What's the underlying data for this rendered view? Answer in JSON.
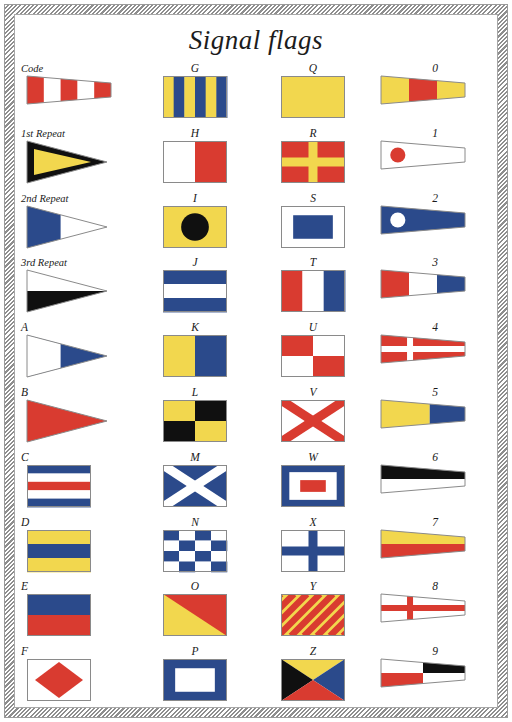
{
  "page": {
    "title": "Signal flags",
    "background": "#ffffff",
    "frame_style": "diagonal-hatch-border"
  },
  "palette": {
    "red": "#d93b30",
    "blue": "#2b4a8b",
    "yellow": "#f2d74e",
    "white": "#ffffff",
    "black": "#101010",
    "outline": "#8a8a8a"
  },
  "columns": [
    {
      "name": "column-repeaters-and-a-f",
      "cells": [
        {
          "label": "Code",
          "shape": "pennant",
          "pattern": "stripes-v",
          "colors": [
            "red",
            "white",
            "red",
            "white",
            "red"
          ]
        },
        {
          "label": "1st Repeat",
          "shape": "triangle-pennant",
          "pattern": "border-triangle",
          "colors": [
            "yellow",
            "black"
          ]
        },
        {
          "label": "2nd Repeat",
          "shape": "triangle-pennant",
          "pattern": "half-v",
          "colors": [
            "blue",
            "white"
          ]
        },
        {
          "label": "3rd Repeat",
          "shape": "triangle-pennant",
          "pattern": "half-h",
          "colors": [
            "white",
            "black"
          ]
        },
        {
          "label": "A",
          "shape": "swallowtail",
          "pattern": "half-v",
          "colors": [
            "white",
            "blue"
          ]
        },
        {
          "label": "B",
          "shape": "swallowtail",
          "pattern": "solid",
          "colors": [
            "red"
          ]
        },
        {
          "label": "C",
          "shape": "rect",
          "pattern": "stripes-h5",
          "colors": [
            "blue",
            "white",
            "red",
            "white",
            "blue"
          ]
        },
        {
          "label": "D",
          "shape": "rect",
          "pattern": "stripes-h3",
          "colors": [
            "yellow",
            "blue",
            "yellow"
          ]
        },
        {
          "label": "E",
          "shape": "rect",
          "pattern": "stripes-h2",
          "colors": [
            "blue",
            "red"
          ]
        },
        {
          "label": "F",
          "shape": "rect",
          "pattern": "diamond",
          "colors": [
            "white",
            "red"
          ]
        }
      ]
    },
    {
      "name": "column-g-to-p",
      "cells": [
        {
          "label": "G",
          "shape": "rect",
          "pattern": "stripes-v6",
          "colors": [
            "yellow",
            "blue",
            "yellow",
            "blue",
            "yellow",
            "blue"
          ]
        },
        {
          "label": "H",
          "shape": "rect",
          "pattern": "half-v",
          "colors": [
            "white",
            "red"
          ]
        },
        {
          "label": "I",
          "shape": "rect",
          "pattern": "circle",
          "colors": [
            "yellow",
            "black"
          ]
        },
        {
          "label": "J",
          "shape": "rect",
          "pattern": "stripes-h3",
          "colors": [
            "blue",
            "white",
            "blue"
          ]
        },
        {
          "label": "K",
          "shape": "rect",
          "pattern": "half-v",
          "colors": [
            "yellow",
            "blue"
          ]
        },
        {
          "label": "L",
          "shape": "rect",
          "pattern": "quarters",
          "colors": [
            "yellow",
            "black",
            "black",
            "yellow"
          ]
        },
        {
          "label": "M",
          "shape": "rect",
          "pattern": "saltire",
          "colors": [
            "blue",
            "white"
          ]
        },
        {
          "label": "N",
          "shape": "rect",
          "pattern": "checker",
          "colors": [
            "blue",
            "white"
          ]
        },
        {
          "label": "O",
          "shape": "rect",
          "pattern": "diagonal-half",
          "colors": [
            "red",
            "yellow"
          ]
        },
        {
          "label": "P",
          "shape": "rect",
          "pattern": "rect-center",
          "colors": [
            "blue",
            "white"
          ]
        }
      ]
    },
    {
      "name": "column-q-to-z",
      "cells": [
        {
          "label": "Q",
          "shape": "rect",
          "pattern": "solid",
          "colors": [
            "yellow"
          ]
        },
        {
          "label": "R",
          "shape": "rect",
          "pattern": "cross",
          "colors": [
            "red",
            "yellow"
          ]
        },
        {
          "label": "S",
          "shape": "rect",
          "pattern": "rect-center",
          "colors": [
            "white",
            "blue"
          ]
        },
        {
          "label": "T",
          "shape": "rect",
          "pattern": "stripes-v3",
          "colors": [
            "red",
            "white",
            "blue"
          ]
        },
        {
          "label": "U",
          "shape": "rect",
          "pattern": "quarters",
          "colors": [
            "red",
            "white",
            "white",
            "red"
          ]
        },
        {
          "label": "V",
          "shape": "rect",
          "pattern": "saltire",
          "colors": [
            "white",
            "red"
          ]
        },
        {
          "label": "W",
          "shape": "rect",
          "pattern": "nested-rects",
          "colors": [
            "blue",
            "white",
            "red"
          ]
        },
        {
          "label": "X",
          "shape": "rect",
          "pattern": "cross",
          "colors": [
            "white",
            "blue"
          ]
        },
        {
          "label": "Y",
          "shape": "rect",
          "pattern": "diagonal-stripes",
          "colors": [
            "yellow",
            "red"
          ]
        },
        {
          "label": "Z",
          "shape": "rect",
          "pattern": "quarter-triangles",
          "colors": [
            "black",
            "yellow",
            "blue",
            "red"
          ]
        }
      ]
    },
    {
      "name": "column-numerals",
      "cells": [
        {
          "label": "0",
          "shape": "pennant",
          "pattern": "stripes-v3",
          "colors": [
            "yellow",
            "red",
            "yellow"
          ]
        },
        {
          "label": "1",
          "shape": "pennant",
          "pattern": "circle",
          "colors": [
            "white",
            "red"
          ]
        },
        {
          "label": "2",
          "shape": "pennant",
          "pattern": "circle",
          "colors": [
            "blue",
            "white"
          ]
        },
        {
          "label": "3",
          "shape": "pennant",
          "pattern": "stripes-v3",
          "colors": [
            "red",
            "white",
            "blue"
          ]
        },
        {
          "label": "4",
          "shape": "pennant",
          "pattern": "cross",
          "colors": [
            "red",
            "white"
          ]
        },
        {
          "label": "5",
          "shape": "pennant",
          "pattern": "half-v",
          "colors": [
            "yellow",
            "blue"
          ]
        },
        {
          "label": "6",
          "shape": "pennant",
          "pattern": "half-h",
          "colors": [
            "black",
            "white"
          ]
        },
        {
          "label": "7",
          "shape": "pennant",
          "pattern": "half-h",
          "colors": [
            "yellow",
            "red"
          ]
        },
        {
          "label": "8",
          "shape": "pennant",
          "pattern": "cross",
          "colors": [
            "white",
            "red"
          ]
        },
        {
          "label": "9",
          "shape": "pennant",
          "pattern": "quarters",
          "colors": [
            "white",
            "black",
            "red",
            "white"
          ]
        }
      ]
    }
  ]
}
